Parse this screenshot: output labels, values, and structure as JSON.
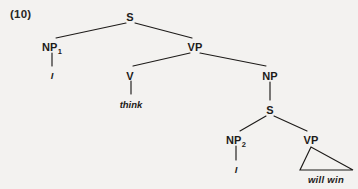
{
  "figure": {
    "example_number": "(10)",
    "caption": "",
    "background_color": "#f3f2f0",
    "ink_color": "#1d1b19"
  },
  "tree": {
    "nodes": [
      {
        "id": "S1",
        "label": "S",
        "subscript": "",
        "x": 130,
        "y": 11,
        "kind": "nonterminal"
      },
      {
        "id": "NP1",
        "label": "NP",
        "subscript": "1",
        "x": 52,
        "y": 41,
        "kind": "nonterminal"
      },
      {
        "id": "VP1",
        "label": "VP",
        "subscript": "",
        "x": 195,
        "y": 41,
        "kind": "nonterminal"
      },
      {
        "id": "V",
        "label": "V",
        "subscript": "",
        "x": 130,
        "y": 70,
        "kind": "nonterminal"
      },
      {
        "id": "NP3",
        "label": "NP",
        "subscript": "",
        "x": 270,
        "y": 70,
        "kind": "nonterminal"
      },
      {
        "id": "S2",
        "label": "S",
        "subscript": "",
        "x": 270,
        "y": 104,
        "kind": "nonterminal"
      },
      {
        "id": "NP2",
        "label": "NP",
        "subscript": "2",
        "x": 236,
        "y": 134,
        "kind": "nonterminal"
      },
      {
        "id": "VP2",
        "label": "VP",
        "subscript": "",
        "x": 311,
        "y": 134,
        "kind": "nonterminal"
      }
    ],
    "terminals": [
      {
        "id": "t-i-1",
        "text": "I",
        "x": 52,
        "y": 70,
        "parent": "NP1"
      },
      {
        "id": "t-think",
        "text": "think",
        "x": 131,
        "y": 99,
        "parent": "V"
      },
      {
        "id": "t-i-2",
        "text": "I",
        "x": 236,
        "y": 164,
        "parent": "NP2"
      },
      {
        "id": "t-will-win",
        "text": "will win",
        "x": 326,
        "y": 174,
        "parent": "VP2"
      }
    ],
    "edges": [
      {
        "from": "S1",
        "to": "NP1",
        "x1": 126,
        "y1": 23,
        "x2": 56,
        "y2": 38,
        "type": "branch"
      },
      {
        "from": "S1",
        "to": "VP1",
        "x1": 135,
        "y1": 23,
        "x2": 192,
        "y2": 38,
        "type": "branch"
      },
      {
        "from": "NP1",
        "to": "t-i-1",
        "x1": 52,
        "y1": 53,
        "x2": 52,
        "y2": 66,
        "type": "stem"
      },
      {
        "from": "VP1",
        "to": "V",
        "x1": 190,
        "y1": 53,
        "x2": 133,
        "y2": 66,
        "type": "branch"
      },
      {
        "from": "VP1",
        "to": "NP3",
        "x1": 200,
        "y1": 53,
        "x2": 266,
        "y2": 66,
        "type": "branch"
      },
      {
        "from": "V",
        "to": "t-think",
        "x1": 131,
        "y1": 81,
        "x2": 131,
        "y2": 94,
        "type": "stem"
      },
      {
        "from": "NP3",
        "to": "S2",
        "x1": 270,
        "y1": 82,
        "x2": 270,
        "y2": 100,
        "type": "stem"
      },
      {
        "from": "S2",
        "to": "NP2",
        "x1": 266,
        "y1": 116,
        "x2": 240,
        "y2": 131,
        "type": "branch"
      },
      {
        "from": "S2",
        "to": "VP2",
        "x1": 274,
        "y1": 116,
        "x2": 307,
        "y2": 131,
        "type": "branch"
      },
      {
        "from": "NP2",
        "to": "t-i-2",
        "x1": 236,
        "y1": 146,
        "x2": 236,
        "y2": 160,
        "type": "stem"
      }
    ],
    "triangles": [
      {
        "id": "vp2-triangle",
        "parent": "VP2",
        "covers": "will win",
        "apex_x": 311,
        "apex_y": 147,
        "left_x": 300,
        "left_y": 170,
        "right_x": 353,
        "right_y": 170
      }
    ]
  }
}
